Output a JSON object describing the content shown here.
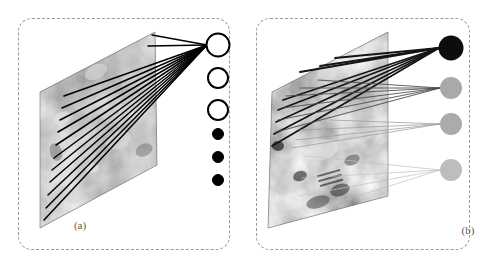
{
  "figure": {
    "type": "diagram",
    "background_color": "#ffffff",
    "border_color": "#9a9a9a",
    "border_style": "dashed-rounded"
  },
  "panels": [
    {
      "id": "a",
      "caption": "(a)",
      "plane": {
        "name": "feature-map-plane",
        "corners": [
          [
            155,
            32
          ],
          [
            40,
            92
          ],
          [
            40,
            228
          ],
          [
            157,
            165
          ]
        ],
        "texture": "grayscale-microstructure",
        "base_color": "#8d8d8d"
      },
      "nodes": [
        {
          "index": 0,
          "cx": 218,
          "cy": 45,
          "r": 11.5,
          "fill": "#ffffff",
          "stroke": "#000000",
          "stroke_width": 2,
          "style": "hollow"
        },
        {
          "index": 1,
          "cx": 218,
          "cy": 78,
          "r": 10.0,
          "fill": "#ffffff",
          "stroke": "#000000",
          "stroke_width": 2,
          "style": "hollow"
        },
        {
          "index": 2,
          "cx": 218,
          "cy": 110,
          "r": 10.0,
          "fill": "#ffffff",
          "stroke": "#000000",
          "stroke_width": 2,
          "style": "hollow"
        },
        {
          "index": 3,
          "cx": 218,
          "cy": 134,
          "r": 5.5,
          "fill": "#000000",
          "stroke": "#000000",
          "stroke_width": 1,
          "style": "ellipsis-dot"
        },
        {
          "index": 4,
          "cx": 218,
          "cy": 157,
          "r": 5.5,
          "fill": "#000000",
          "stroke": "#000000",
          "stroke_width": 1,
          "style": "ellipsis-dot"
        },
        {
          "index": 5,
          "cx": 218,
          "cy": 180,
          "r": 5.5,
          "fill": "#000000",
          "stroke": "#000000",
          "stroke_width": 1,
          "style": "ellipsis-dot"
        }
      ],
      "edges": {
        "name": "uniform-connections",
        "count": 13,
        "target": [
          207,
          45
        ],
        "color": "#000000",
        "width": 1.5,
        "opacity": 1,
        "sources": [
          [
            152,
            35
          ],
          [
            148,
            46
          ],
          [
            64,
            96
          ],
          [
            62,
            108
          ],
          [
            60,
            120
          ],
          [
            58,
            132
          ],
          [
            56,
            145
          ],
          [
            54,
            158
          ],
          [
            52,
            170
          ],
          [
            50,
            182
          ],
          [
            48,
            195
          ],
          [
            46,
            208
          ],
          [
            44,
            220
          ]
        ]
      }
    },
    {
      "id": "b",
      "caption": "(b)",
      "plane": {
        "name": "feature-map-plane",
        "corners": [
          [
            388,
            32
          ],
          [
            272,
            92
          ],
          [
            268,
            228
          ],
          [
            388,
            196
          ]
        ],
        "texture": "grayscale-microstructure",
        "base_color": "#8d8d8d"
      },
      "nodes": [
        {
          "index": 0,
          "cx": 451,
          "cy": 48,
          "r": 12.5,
          "fill": "#0d0d0d",
          "stroke": "none",
          "stroke_width": 0,
          "style": "solid",
          "weight": 1.0
        },
        {
          "index": 1,
          "cx": 451,
          "cy": 88,
          "r": 11.0,
          "fill": "#a9a9a9",
          "stroke": "none",
          "stroke_width": 0,
          "style": "solid",
          "weight": 0.45
        },
        {
          "index": 2,
          "cx": 451,
          "cy": 124,
          "r": 11.0,
          "fill": "#ababab",
          "stroke": "none",
          "stroke_width": 0,
          "style": "solid",
          "weight": 0.42
        },
        {
          "index": 3,
          "cx": 451,
          "cy": 170,
          "r": 11.0,
          "fill": "#bdbdbd",
          "stroke": "none",
          "stroke_width": 0,
          "style": "solid",
          "weight": 0.28
        }
      ],
      "edges": {
        "name": "weighted-connections",
        "color_dark": "#141414",
        "color_mid": "#8a8a8a",
        "color_light": "#c8c8c8",
        "groups": [
          {
            "target": [
              439,
              48
            ],
            "weight": 1.0,
            "color": "#141414",
            "width": 1.8,
            "opacity": 1.0,
            "sources": [
              [
                335,
                58
              ],
              [
                320,
                66
              ],
              [
                300,
                72
              ],
              [
                283,
                100
              ],
              [
                278,
                110
              ],
              [
                276,
                122
              ],
              [
                274,
                134
              ],
              [
                272,
                146
              ]
            ]
          },
          {
            "target": [
              440,
              88
            ],
            "weight": 0.5,
            "color": "#4a4a4a",
            "width": 1.2,
            "opacity": 0.85,
            "sources": [
              [
                286,
                96
              ],
              [
                282,
                108
              ],
              [
                278,
                120
              ],
              [
                276,
                132
              ],
              [
                318,
                80
              ],
              [
                300,
                88
              ]
            ]
          },
          {
            "target": [
              440,
              124
            ],
            "weight": 0.32,
            "color": "#9c9c9c",
            "width": 1.0,
            "opacity": 0.75,
            "sources": [
              [
                300,
                130
              ],
              [
                296,
                140
              ],
              [
                292,
                148
              ],
              [
                330,
                120
              ]
            ]
          },
          {
            "target": [
              440,
              170
            ],
            "weight": 0.2,
            "color": "#c0c0c0",
            "width": 1.0,
            "opacity": 0.7,
            "sources": [
              [
                306,
                156
              ],
              [
                302,
                178
              ],
              [
                300,
                196
              ],
              [
                320,
                208
              ]
            ]
          }
        ]
      }
    }
  ]
}
